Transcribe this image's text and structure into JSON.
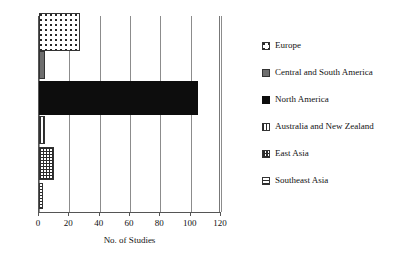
{
  "chart_data": {
    "type": "bar",
    "orientation": "horizontal",
    "title": "",
    "xlabel": "No. of Studies",
    "ylabel": "",
    "xlim": [
      0,
      120
    ],
    "xticks": [
      0,
      20,
      40,
      60,
      80,
      100,
      120
    ],
    "xtick_labels": [
      "0",
      "20",
      "40",
      "60",
      "80",
      "100",
      "120"
    ],
    "grid": "vertical",
    "legend_position": "right",
    "categories": [
      "Europe",
      "Central and South America",
      "North America",
      "Australia and New Zealand",
      "East Asia",
      "Southeast Asia"
    ],
    "values": [
      27,
      4,
      105,
      4,
      10,
      2.5
    ],
    "bars": [
      {
        "label": "Europe",
        "value": 27,
        "pattern": "dots",
        "thickness": 38
      },
      {
        "label": "Central and South America",
        "value": 4,
        "pattern": "dkgray",
        "thickness": 28
      },
      {
        "label": "North America",
        "value": 105,
        "pattern": "black",
        "thickness": 34
      },
      {
        "label": "Australia and New Zealand",
        "value": 4,
        "pattern": "vstripe",
        "thickness": 28
      },
      {
        "label": "East Asia",
        "value": 10,
        "pattern": "check",
        "thickness": 33
      },
      {
        "label": "Southeast Asia",
        "value": 2.5,
        "pattern": "hstripe",
        "thickness": 26
      }
    ],
    "colors": {
      "axis": "#555555",
      "gridline": "#8c8c8c",
      "bar_outline": "#333333",
      "north_america_fill": "#0d0d0d",
      "central_south_america_fill": "#6e6e6e",
      "background": "#ffffff"
    }
  },
  "legend": {
    "items": [
      {
        "label": "Europe",
        "pattern": "dots"
      },
      {
        "label": "Central and South America",
        "pattern": "dkgray"
      },
      {
        "label": "North America",
        "pattern": "black"
      },
      {
        "label": "Australia and New Zealand",
        "pattern": "vstripe"
      },
      {
        "label": "East Asia",
        "pattern": "check"
      },
      {
        "label": "Southeast Asia",
        "pattern": "hstripe"
      }
    ]
  }
}
